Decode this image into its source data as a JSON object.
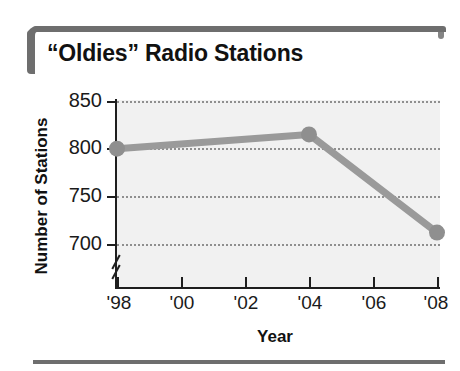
{
  "chart_data": {
    "type": "line",
    "title": "“Oldies” Radio Stations",
    "xlabel": "Year",
    "ylabel": "Number of Stations",
    "categories": [
      "'98",
      "'00",
      "'02",
      "'04",
      "'06",
      "'08"
    ],
    "x": [
      1998,
      2000,
      2002,
      2004,
      2006,
      2008
    ],
    "values": [
      800,
      null,
      null,
      815,
      null,
      712
    ],
    "series": [
      {
        "name": "Number of Stations",
        "points": [
          {
            "x": "'98",
            "year": 1998,
            "y": 800
          },
          {
            "x": "'04",
            "year": 2004,
            "y": 815
          },
          {
            "x": "'08",
            "year": 2008,
            "y": 712
          }
        ]
      }
    ],
    "ytick_labels": [
      "850",
      "800",
      "750",
      "700"
    ],
    "ytick_values": [
      850,
      800,
      750,
      700
    ],
    "xtick_labels": [
      "'98",
      "'00",
      "'02",
      "'04",
      "'06",
      "'08"
    ],
    "ylim": [
      690,
      850
    ],
    "xlim": [
      1998,
      2008
    ],
    "y_axis_break": true,
    "grid": "horizontal-dotted",
    "legend": null,
    "colors": {
      "line": "#9a9a9a",
      "marker": "#8f8f8f",
      "plot_background": "#f1f1f1",
      "axis": "#1e1e1e",
      "gridline": "#8f8f8f",
      "frame": "#6e6e6e",
      "text": "#111111"
    }
  },
  "figure": {
    "title": "“Oldies” Radio Stations",
    "axis_titles": {
      "x": "Year",
      "y": "Number of Stations"
    },
    "y_labels": {
      "t0": "850",
      "t1": "800",
      "t2": "750",
      "t3": "700"
    },
    "x_labels": {
      "t0": "'98",
      "t1": "'00",
      "t2": "'02",
      "t3": "'04",
      "t4": "'06",
      "t5": "'08"
    }
  }
}
